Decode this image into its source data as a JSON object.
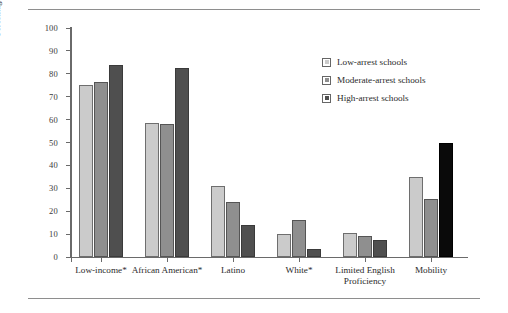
{
  "chart_data": {
    "type": "bar",
    "title": "",
    "xlabel": "",
    "ylabel": "Percentage of Schools in Category",
    "ylim": [
      0,
      100
    ],
    "yticks": [
      0,
      10,
      20,
      30,
      40,
      50,
      60,
      70,
      80,
      90,
      100
    ],
    "grid": false,
    "legend_position": "top-right",
    "categories": [
      "Low-income*",
      "African American*",
      "Latino",
      "White*",
      "Limited English\nProficiency",
      "Mobility"
    ],
    "series": [
      {
        "name": "Low-arrest schools",
        "color": "#cbcbcb",
        "values": [
          75,
          58.5,
          31,
          10,
          10.5,
          35
        ]
      },
      {
        "name": "Moderate-arrest schools",
        "color": "#8f8f8f",
        "values": [
          76.5,
          58,
          24,
          16,
          9,
          25.5
        ]
      },
      {
        "name": "High-arrest schools",
        "color": "#4f4f4f",
        "values": [
          84,
          82.5,
          14,
          3.5,
          7.5,
          50
        ]
      }
    ],
    "series_color_overrides": [
      {
        "series": 2,
        "category": 5,
        "color": "#0a0a0a"
      }
    ]
  },
  "legend": {
    "items": [
      {
        "label": "Low-arrest schools"
      },
      {
        "label": "Moderate-arrest schools"
      },
      {
        "label": "High-arrest schools"
      }
    ]
  },
  "axes": {
    "y_title": "Percentage of Schools in Category"
  }
}
